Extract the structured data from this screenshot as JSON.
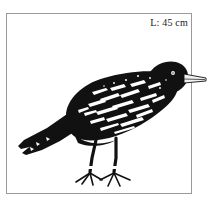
{
  "plate": {
    "size_label": "L: 45 cm",
    "frame_color": "#9a9a9a",
    "background_color": "#ffffff",
    "ink_color": "#111111",
    "highlight_color": "#ffffff"
  },
  "illustration": {
    "subject": "blackbird",
    "subject_label": "black bird perched, side view facing right",
    "icon_name": "bird-illustration",
    "parts": [
      {
        "name": "tail",
        "label": "long pointed tail, lower left"
      },
      {
        "name": "wing",
        "label": "folded wing with white streaks"
      },
      {
        "name": "body",
        "label": "rounded black body"
      },
      {
        "name": "head",
        "label": "black head with small pale eye"
      },
      {
        "name": "beak",
        "label": "pale conical beak pointing right, crosses frame edge"
      },
      {
        "name": "left-leg",
        "label": "dark leg with splayed toes"
      },
      {
        "name": "right-leg",
        "label": "dark leg with splayed toes"
      }
    ]
  }
}
